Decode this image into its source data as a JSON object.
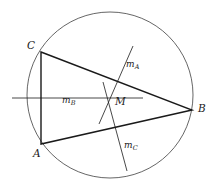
{
  "figure": {
    "kind": "euclidean-geometry-diagram",
    "stroke_color": "#1a1a1a",
    "circle_color": "#555555",
    "background": "#ffffff",
    "canvas": {
      "width": 215,
      "height": 190
    }
  },
  "circle": {
    "name": "circumcircle",
    "cx": 110,
    "cy": 95,
    "r": 83,
    "stroke_width": 0.9
  },
  "vertices": [
    {
      "id": "C",
      "label": "C",
      "x": 41,
      "y": 52,
      "label_x": 27,
      "label_y": 40
    },
    {
      "id": "A",
      "label": "A",
      "x": 41,
      "y": 144,
      "label_x": 33,
      "label_y": 148
    },
    {
      "id": "B",
      "label": "B",
      "x": 192,
      "y": 110,
      "label_x": 198,
      "label_y": 103
    },
    {
      "id": "M",
      "label": "M",
      "x": 110,
      "y": 98,
      "label_x": 115,
      "label_y": 96
    }
  ],
  "triangle": {
    "name": "triangle-ABC",
    "points": "41,52 192,110 41,144",
    "stroke_width": 1.4
  },
  "medians": [
    {
      "id": "mA",
      "label": "m",
      "sub": "A",
      "x1": 133,
      "y1": 46,
      "x2": 99,
      "y2": 124,
      "label_x": 126,
      "label_y": 60
    },
    {
      "id": "mB",
      "label": "m",
      "sub": "B",
      "x1": 12,
      "y1": 98,
      "x2": 143,
      "y2": 98,
      "label_x": 62,
      "label_y": 96
    },
    {
      "id": "mC",
      "label": "m",
      "sub": "C",
      "x1": 103,
      "y1": 82,
      "x2": 127,
      "y2": 171,
      "label_x": 124,
      "label_y": 141
    }
  ]
}
